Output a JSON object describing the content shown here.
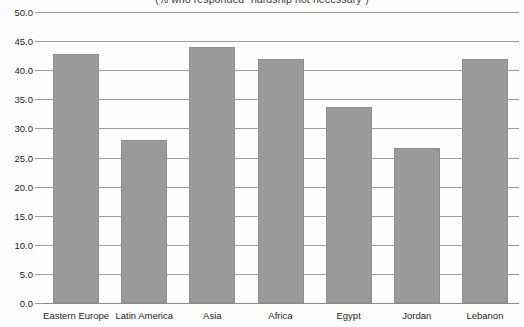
{
  "chart_data": {
    "type": "bar",
    "title": "",
    "subtitle": "(% who responded “hardship not necessary”)",
    "xlabel": "",
    "ylabel": "",
    "categories": [
      "Eastern Europe",
      "Latin America",
      "Asia",
      "Africa",
      "Egypt",
      "Jordan",
      "Lebanon"
    ],
    "values": [
      42.8,
      28.0,
      44.0,
      42.0,
      33.7,
      26.7,
      42.0
    ],
    "ylim": [
      0.0,
      50.0
    ],
    "ytick_labels": [
      "0.0",
      "5.0",
      "10.0",
      "15.0",
      "20.0",
      "25.0",
      "30.0",
      "35.0",
      "40.0",
      "45.0",
      "50.0"
    ],
    "ytick_values": [
      0.0,
      5.0,
      10.0,
      15.0,
      20.0,
      25.0,
      30.0,
      35.0,
      40.0,
      45.0,
      50.0
    ],
    "grid": true,
    "legend": null,
    "legend_position": "none",
    "bar_color": "#9a9a9a",
    "grid_color": "#9c9c9c",
    "background_color": "#fdfdfd",
    "text_color": "#1e1e1e"
  }
}
